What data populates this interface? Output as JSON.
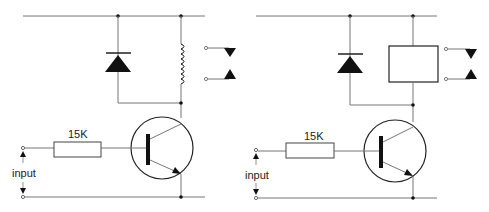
{
  "circuits": [
    {
      "name": "relay-driver-coil",
      "resistor_label": "15K",
      "input_label": "input",
      "load_symbol": "inductor-coil"
    },
    {
      "name": "relay-driver-box",
      "resistor_label": "15K",
      "input_label": "input",
      "load_symbol": "relay-box"
    }
  ],
  "colors": {
    "wire": "#777777",
    "component": "#111111",
    "background": "#ffffff"
  }
}
